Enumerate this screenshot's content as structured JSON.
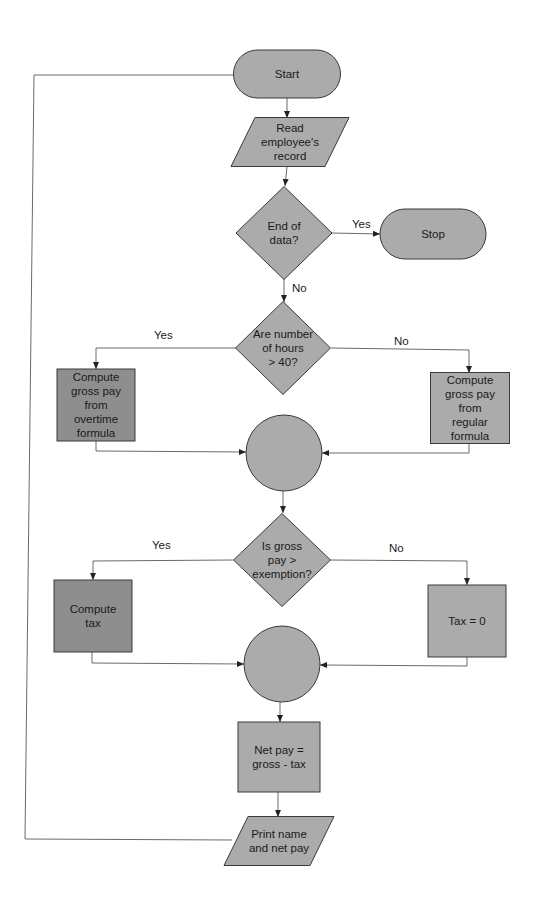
{
  "colors": {
    "node_fill": "#ababab",
    "node_fill_dark": "#8e8e8e",
    "line": "#6a6a6a",
    "text": "#1a1a1a"
  },
  "nodes": [
    {
      "id": "start",
      "type": "terminal",
      "lines": [
        "Start"
      ]
    },
    {
      "id": "read",
      "type": "io",
      "lines": [
        "Read",
        "employee's",
        "record"
      ]
    },
    {
      "id": "end_of_data",
      "type": "decision",
      "lines": [
        "End of",
        "data?"
      ]
    },
    {
      "id": "stop",
      "type": "terminal",
      "lines": [
        "Stop"
      ]
    },
    {
      "id": "hours_gt_40",
      "type": "decision",
      "lines": [
        "Are number",
        "of hours",
        ">  40?"
      ]
    },
    {
      "id": "overtime",
      "type": "process",
      "shade": "dark",
      "lines": [
        "Compute",
        "gross pay",
        "from",
        "overtime",
        "formula"
      ]
    },
    {
      "id": "regular",
      "type": "process",
      "lines": [
        "Compute",
        "gross pay",
        "from",
        "regular",
        "formula"
      ]
    },
    {
      "id": "connector1",
      "type": "connector",
      "lines": []
    },
    {
      "id": "gross_gt_exemption",
      "type": "decision",
      "lines": [
        "Is gross",
        "pay  >",
        "exemption?"
      ]
    },
    {
      "id": "compute_tax",
      "type": "process",
      "shade": "dark",
      "lines": [
        "Compute",
        "tax"
      ]
    },
    {
      "id": "tax_zero",
      "type": "process",
      "lines": [
        "Tax  =  0"
      ]
    },
    {
      "id": "connector2",
      "type": "connector",
      "lines": []
    },
    {
      "id": "net_pay",
      "type": "process",
      "lines": [
        "Net pay  =",
        "gross  -  tax"
      ]
    },
    {
      "id": "print",
      "type": "io",
      "lines": [
        "Print name",
        "and net pay"
      ]
    }
  ],
  "edges": [
    {
      "from": "start",
      "to": "read",
      "label": ""
    },
    {
      "from": "read",
      "to": "end_of_data",
      "label": ""
    },
    {
      "from": "end_of_data",
      "to": "stop",
      "label": "Yes"
    },
    {
      "from": "end_of_data",
      "to": "hours_gt_40",
      "label": "No"
    },
    {
      "from": "hours_gt_40",
      "to": "overtime",
      "label": "Yes"
    },
    {
      "from": "hours_gt_40",
      "to": "regular",
      "label": "No"
    },
    {
      "from": "overtime",
      "to": "connector1",
      "label": ""
    },
    {
      "from": "regular",
      "to": "connector1",
      "label": ""
    },
    {
      "from": "connector1",
      "to": "gross_gt_exemption",
      "label": ""
    },
    {
      "from": "gross_gt_exemption",
      "to": "compute_tax",
      "label": "Yes"
    },
    {
      "from": "gross_gt_exemption",
      "to": "tax_zero",
      "label": "No"
    },
    {
      "from": "compute_tax",
      "to": "connector2",
      "label": ""
    },
    {
      "from": "tax_zero",
      "to": "connector2",
      "label": ""
    },
    {
      "from": "connector2",
      "to": "net_pay",
      "label": ""
    },
    {
      "from": "net_pay",
      "to": "print",
      "label": ""
    },
    {
      "from": "print",
      "to": "start",
      "label": ""
    }
  ]
}
